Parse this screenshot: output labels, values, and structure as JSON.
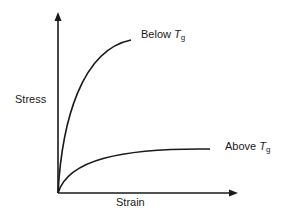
{
  "diagram": {
    "type": "stress-strain curves",
    "y_axis_label": "Stress",
    "x_axis_label": "Strain",
    "curves": [
      {
        "name": "below-tg",
        "label_prefix": "Below ",
        "label_var": "T",
        "label_sub": "g",
        "description": "steep rise, plateaus high"
      },
      {
        "name": "above-tg",
        "label_prefix": "Above ",
        "label_var": "T",
        "label_sub": "g",
        "description": "gradual rise, plateaus low"
      }
    ],
    "line_color": "#1a1a1a"
  }
}
